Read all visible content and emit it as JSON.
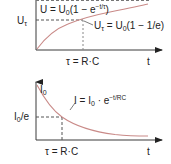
{
  "colors": {
    "axis": "#3a3a3a",
    "curve": "#c98a88",
    "dashed": "#555555",
    "text": "#222222"
  },
  "top_chart": {
    "title": "Capacitor charging voltage",
    "y_axis_label": "U_τ",
    "y_axis_label_main": "U",
    "y_axis_label_sub": "τ",
    "x_axis_label": "t",
    "tau_label": "τ = R·C",
    "formula_curve": {
      "prefix": "U = U",
      "sub": "0",
      "mid": "(1 − e",
      "sup": "−t/τ",
      "suffix": ")"
    },
    "formula_point": {
      "prefix": "U",
      "sub1": "τ",
      "mid": " = U",
      "sub2": "0",
      "suffix": "(1 − 1/e)"
    }
  },
  "bottom_chart": {
    "title": "Capacitor discharge current",
    "y_axis_label_main": "I",
    "y_axis_label_sub": "0",
    "level_label_main": "I",
    "level_label_sub": "0",
    "level_label_suffix": "/e",
    "x_axis_label": "t",
    "tau_label": "τ = R·C",
    "formula_curve": {
      "prefix": "I = I",
      "sub": "0",
      "mid": " · e",
      "sup": "−t/RC"
    }
  }
}
